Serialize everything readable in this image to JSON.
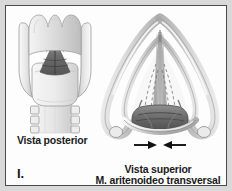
{
  "plate": {
    "figure_index": "I.",
    "background_color": "#d9d9d9",
    "panel_color": "#fdfdfd",
    "border_color": "#4a4a4a",
    "ink_color": "#1b1b1b"
  },
  "figures": {
    "posterior": {
      "caption": "Vista posterior",
      "view_name": "posterior-view-larynx"
    },
    "superior": {
      "caption_line1": "Vista superior",
      "caption_line2": "M. aritenoideo transversal",
      "view_name": "superior-view-larynx"
    }
  },
  "annotations": {
    "arrow_left": "arrow-pointing-right",
    "arrow_right": "arrow-pointing-left"
  }
}
